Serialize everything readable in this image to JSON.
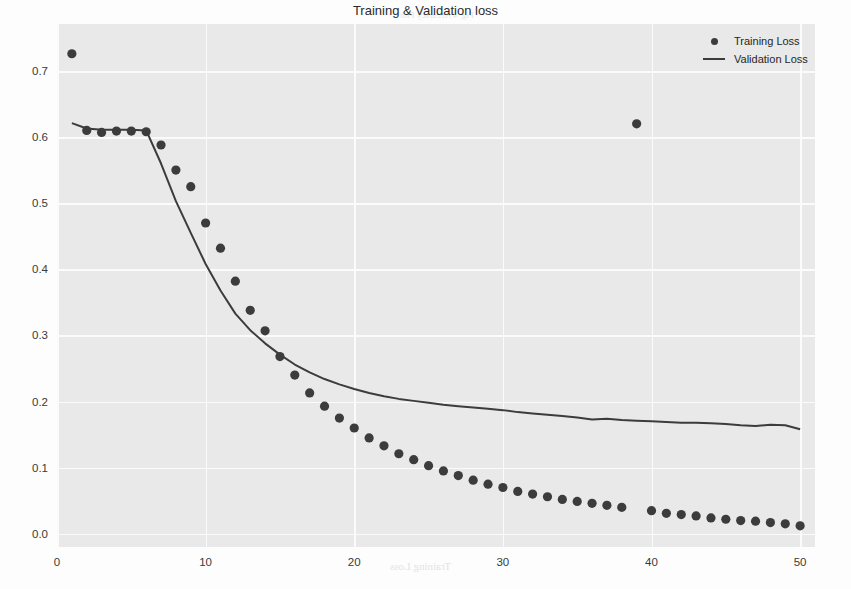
{
  "figure": {
    "title": "Training & Validation loss",
    "background_color": "#fdfdfd",
    "plot_background_color": "#e9e9e9",
    "grid_color": "#fbfbfb",
    "series_color": "#3c3c3c"
  },
  "legend": {
    "position": "upper-right",
    "entries": [
      {
        "label": "Training Loss",
        "marker": "dot-marker-icon"
      },
      {
        "label": "Validation Loss",
        "marker": "line-marker-icon"
      }
    ]
  },
  "bleed_through": {
    "title_line_1": "Empirical Analysis of VLSI Implementation for",
    "title_line_2": "Important Signal Processing Systems",
    "author_line_1": "Sibashis Bhaskar    Mohammed Waseem",
    "author_line_2": "Dinesh Kumar Reddy   Sanjeev Kumar",
    "author_line_3": "Somya Goel",
    "caption_1": "Fig. 4 Accuracy Plot",
    "caption_2": "Fig. 5 Loss Plot",
    "footer": "4. CONCLUSION"
  },
  "chart_data": {
    "type": "line",
    "title": "Training & Validation loss",
    "xlabel": "",
    "ylabel": "",
    "xlim": [
      0,
      51
    ],
    "ylim": [
      -0.02,
      0.771
    ],
    "grid": true,
    "legend_position": "upper right",
    "xticks": [
      0,
      10,
      20,
      30,
      40,
      50
    ],
    "xtick_labels": [
      "0",
      "10",
      "20",
      "30",
      "40",
      "50"
    ],
    "yticks": [
      0.0,
      0.1,
      0.2,
      0.3,
      0.4,
      0.5,
      0.6,
      0.7
    ],
    "ytick_labels": [
      "0.0",
      "0.1",
      "0.2",
      "0.3",
      "0.4",
      "0.5",
      "0.6",
      "0.7"
    ],
    "x": [
      1,
      2,
      3,
      4,
      5,
      6,
      7,
      8,
      9,
      10,
      11,
      12,
      13,
      14,
      15,
      16,
      17,
      18,
      19,
      20,
      21,
      22,
      23,
      24,
      25,
      26,
      27,
      28,
      29,
      30,
      31,
      32,
      33,
      34,
      35,
      36,
      37,
      38,
      39,
      40,
      41,
      42,
      43,
      44,
      45,
      46,
      47,
      48,
      49,
      50
    ],
    "series": [
      {
        "name": "Training Loss",
        "style": "scatter",
        "marker": "o",
        "color": "#3c3c3c",
        "values": [
          0.726,
          0.61,
          0.607,
          0.609,
          0.609,
          0.608,
          0.588,
          0.55,
          0.525,
          0.47,
          0.432,
          0.382,
          0.338,
          0.307,
          0.268,
          0.24,
          0.213,
          0.193,
          0.175,
          0.16,
          0.145,
          0.133,
          0.121,
          0.112,
          0.103,
          0.095,
          0.088,
          0.081,
          0.075,
          0.07,
          0.064,
          0.06,
          0.056,
          0.052,
          0.049,
          0.046,
          0.043,
          0.04,
          0.62,
          0.035,
          0.031,
          0.029,
          0.027,
          0.024,
          0.022,
          0.02,
          0.019,
          0.017,
          0.015,
          0.012
        ]
      },
      {
        "name": "Validation Loss",
        "style": "line",
        "color": "#3c3c3c",
        "values": [
          0.621,
          0.613,
          0.611,
          0.611,
          0.611,
          0.61,
          0.56,
          0.503,
          0.455,
          0.408,
          0.368,
          0.333,
          0.308,
          0.288,
          0.271,
          0.256,
          0.244,
          0.234,
          0.226,
          0.219,
          0.213,
          0.208,
          0.204,
          0.201,
          0.198,
          0.195,
          0.193,
          0.191,
          0.189,
          0.187,
          0.184,
          0.182,
          0.18,
          0.178,
          0.176,
          0.173,
          0.174,
          0.172,
          0.171,
          0.17,
          0.169,
          0.168,
          0.168,
          0.167,
          0.166,
          0.164,
          0.163,
          0.165,
          0.164,
          0.158
        ]
      }
    ]
  }
}
